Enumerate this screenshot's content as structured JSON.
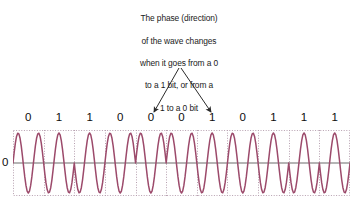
{
  "figure": {
    "kind": "phase-shift-keying-waveform-diagram",
    "background_color": "#ffffff"
  },
  "annotation": {
    "lines": [
      "The phase (direction)",
      "of the wave changes",
      "when it goes from a 0",
      "to a 1 bit, or from a",
      "1 to a 0 bit"
    ],
    "text_color": "#1a1a1a",
    "arrow_color": "#2b2b2b",
    "arrows": [
      {
        "name": "left-arrow",
        "from_x": 179,
        "from_y": 68,
        "to_x": 154,
        "to_y": 112
      },
      {
        "name": "right-arrow",
        "from_x": 181,
        "from_y": 68,
        "to_x": 211,
        "to_y": 112
      }
    ]
  },
  "axis": {
    "zero_label": "0",
    "zero_line_color": "#6d6d6d",
    "grid_color": "#b7a0b0",
    "grid_style": "dotted"
  },
  "chart_data": {
    "type": "line",
    "title": "",
    "xlabel": "",
    "ylabel": "",
    "ylim": [
      -1,
      1
    ],
    "xlim": [
      0,
      11
    ],
    "grid": true,
    "legend": null,
    "waveform_color": "#9c4a6b",
    "bit_labels": [
      "0",
      "1",
      "1",
      "0",
      "0",
      "0",
      "1",
      "0",
      "1",
      "1",
      "1"
    ],
    "bits": [
      0,
      1,
      1,
      0,
      0,
      0,
      1,
      0,
      1,
      1,
      1
    ],
    "bit_count": 11,
    "cycles_per_bit": 1.5,
    "modulation": "BPSK",
    "phase_per_bit_degrees": [
      0,
      180,
      180,
      0,
      0,
      0,
      180,
      0,
      180,
      180,
      180
    ],
    "phase_change_points": [
      1,
      3,
      6,
      7,
      8
    ],
    "series": [
      {
        "name": "carrier",
        "description": "Sinusoid whose phase inverts 180 degrees at each 0-to-1 or 1-to-0 bit transition"
      }
    ]
  }
}
